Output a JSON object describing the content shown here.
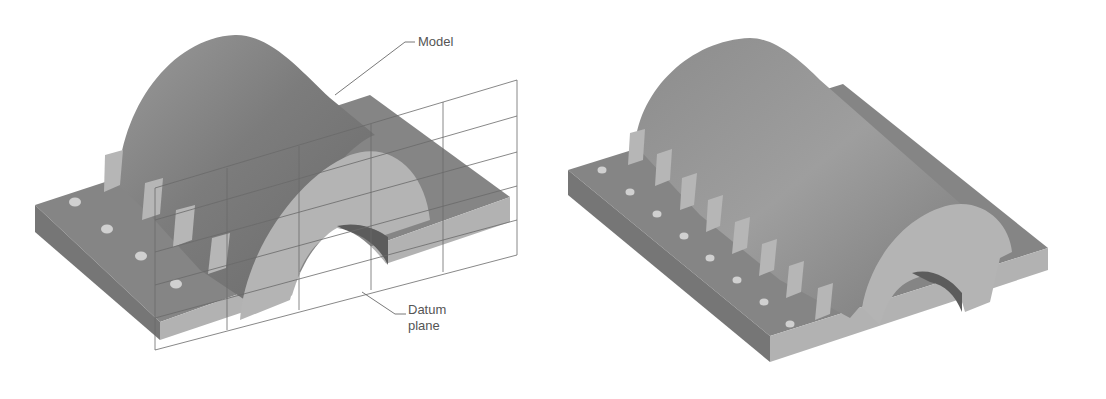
{
  "figure": {
    "left_panel": {
      "description": "Solid model with datum plane shown as grid",
      "labels": {
        "model": "Model",
        "datum_line1": "Datum",
        "datum_line2": "plane"
      }
    },
    "right_panel": {
      "description": "Solid model with ribs and holes patterned along the base"
    },
    "colors": {
      "background": "#ffffff",
      "plate_top": "#8a8a8a",
      "plate_side_dark": "#7a7a7a",
      "plate_front_light": "#b4b4b4",
      "dome_dark": "#6e6e6e",
      "dome_light": "#a8a8a8",
      "arch_face": "#b6b6b6",
      "rib_face": "#b8b8b8",
      "hole": "#d0d0d0",
      "grid_line": "#666666",
      "label_text": "#555555"
    }
  }
}
